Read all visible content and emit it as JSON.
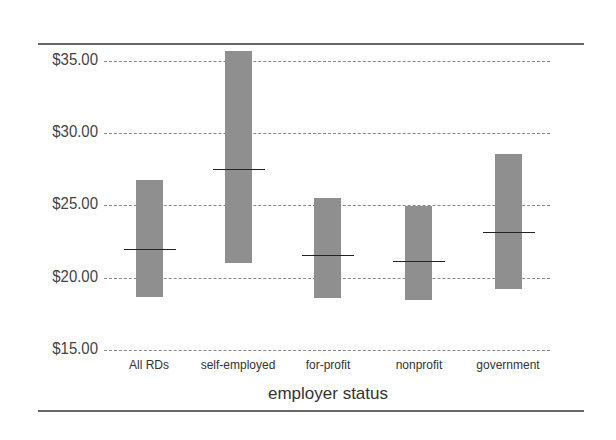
{
  "chart_data": {
    "type": "bar",
    "subtype": "floating-range-with-median",
    "title": "",
    "xlabel": "employer status",
    "ylabel": "",
    "categories": [
      "All RDs",
      "self-employed",
      "for-profit",
      "nonprofit",
      "government"
    ],
    "series": [
      {
        "name": "low",
        "values": [
          18.7,
          21.0,
          18.6,
          18.5,
          19.2
        ]
      },
      {
        "name": "high",
        "values": [
          26.75,
          35.7,
          25.5,
          25.0,
          28.6
        ]
      },
      {
        "name": "median",
        "values": [
          22.0,
          27.5,
          21.6,
          21.2,
          23.2
        ]
      }
    ],
    "yticks": [
      "$15.00",
      "$20.00",
      "$25.00",
      "$30.00",
      "$35.00"
    ],
    "ylim": [
      15,
      35.7
    ],
    "grid": true,
    "legend": null
  },
  "axis": {
    "y_ticks": [
      {
        "label": "$35.00",
        "value": 35
      },
      {
        "label": "$30.00",
        "value": 30
      },
      {
        "label": "$25.00",
        "value": 25
      },
      {
        "label": "$20.00",
        "value": 20
      },
      {
        "label": "$15.00",
        "value": 15
      }
    ],
    "x_title": "employer status",
    "x_labels": [
      "All RDs",
      "self-employed",
      "for-profit",
      "nonprofit",
      "government"
    ]
  },
  "colors": {
    "bar": "#8f8f8f",
    "median": "#222222",
    "grid": "#888888"
  }
}
